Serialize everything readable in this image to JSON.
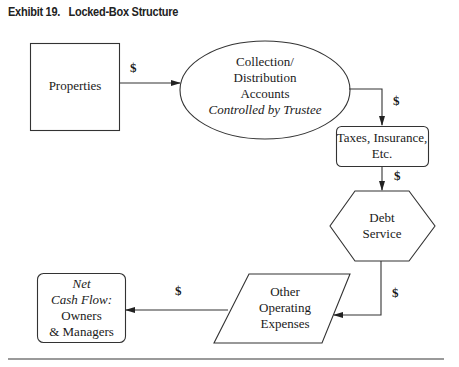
{
  "exhibit": {
    "number_label": "Exhibit 19.",
    "title": "Locked-Box Structure"
  },
  "nodes": {
    "properties": {
      "label": "Properties",
      "shape": "rectangle"
    },
    "collection": {
      "line1": "Collection/",
      "line2": "Distribution",
      "line3": "Accounts",
      "line4": "Controlled by Trustee",
      "shape": "ellipse"
    },
    "taxes": {
      "line1": "Taxes, Insurance,",
      "line2": "Etc.",
      "shape": "rounded-rectangle"
    },
    "debt": {
      "line1": "Debt",
      "line2": "Service",
      "shape": "hexagon"
    },
    "other": {
      "line1": "Other",
      "line2": "Operating",
      "line3": "Expenses",
      "shape": "parallelogram"
    },
    "net": {
      "line1": "Net",
      "line2": "Cash Flow:",
      "line3": "Owners",
      "line4": "& Managers",
      "shape": "rounded-rectangle"
    }
  },
  "edges": [
    {
      "from": "properties",
      "to": "collection",
      "label": "$"
    },
    {
      "from": "collection",
      "to": "taxes",
      "label": "$"
    },
    {
      "from": "taxes",
      "to": "debt",
      "label": "$"
    },
    {
      "from": "debt",
      "to": "other",
      "label": "$"
    },
    {
      "from": "other",
      "to": "net",
      "label": "$"
    }
  ]
}
